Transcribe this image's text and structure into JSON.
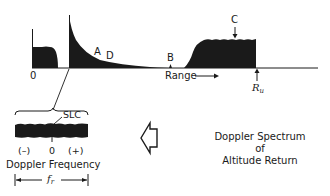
{
  "range_plot": {
    "origin_label": "0",
    "axis_label": "Range",
    "axis_arrow": "→",
    "markers": {
      "A": "A",
      "B": "B",
      "C": "C",
      "D": "D"
    },
    "unambiguous_range": {
      "symbol": "R",
      "subscript": "u"
    }
  },
  "doppler_plot": {
    "slc_label": "SLC",
    "neg_label": "(–)",
    "zero_label": "0",
    "pos_label": "(+)",
    "axis_label": "Doppler Frequency",
    "width_symbol": "f",
    "width_subscript": "r"
  },
  "caption": {
    "line1": "Doppler Spectrum",
    "line2": "of",
    "line3": "Altitude Return"
  },
  "colors": {
    "ink": "#1a1a1a",
    "background": "#ffffff"
  }
}
